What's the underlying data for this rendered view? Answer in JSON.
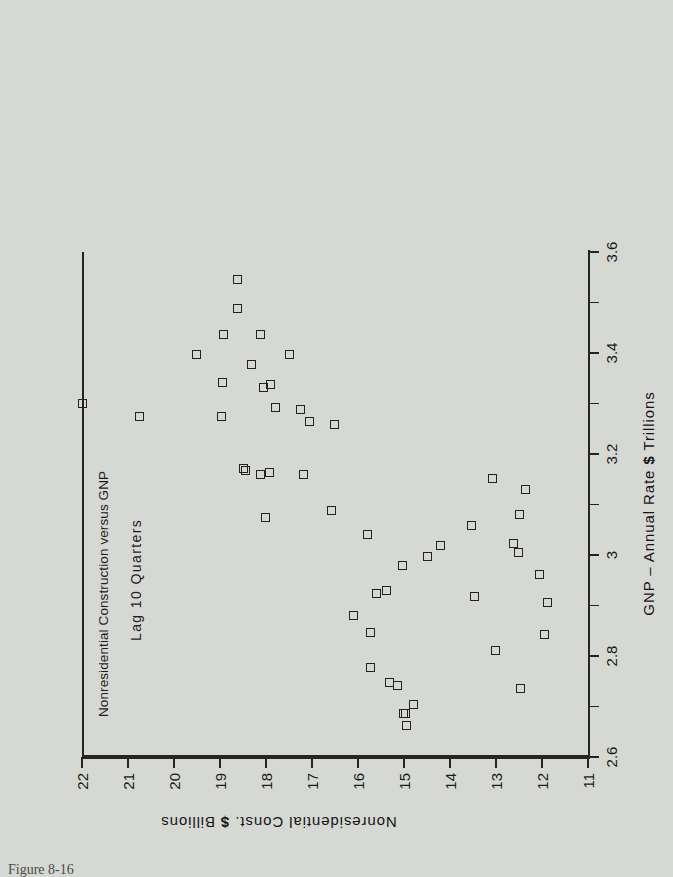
{
  "figure": {
    "background_color": "#d6d8d3",
    "ink_color": "#222222",
    "caption": "Figure 8-16"
  },
  "title": {
    "main": "Nonresidential Construction versus GNP",
    "subtitle": "Lag 10 Quarters"
  },
  "axes": {
    "x_title_part1": "GNP",
    "x_title_dash": "–",
    "x_title_part2": "Annual Rate",
    "x_title_dollar": "$",
    "x_title_part3": "Trillions",
    "y_title_part1": "Nonresidential Const.",
    "y_title_dollar": "$",
    "y_title_part2": "Billions"
  },
  "chart_data": {
    "type": "scatter",
    "title": "Nonresidential Construction versus GNP",
    "subtitle": "Lag 10 Quarters",
    "xlabel": "GNP – Annual Rate $ Trillions",
    "ylabel": "Nonresidential Const. $ Billions",
    "xlim": [
      2.6,
      3.6
    ],
    "ylim": [
      11,
      22
    ],
    "grid": false,
    "legend": null,
    "marker": "open-square",
    "xticks_major": [
      "2.6",
      "2.8",
      "3",
      "3.2",
      "3.4",
      "3.6"
    ],
    "xticks_major_values": [
      2.6,
      2.8,
      3.0,
      3.2,
      3.4,
      3.6
    ],
    "xticks_minor_values": [
      2.7,
      2.9,
      3.1,
      3.3,
      3.5
    ],
    "yticks": [
      "11",
      "12",
      "13",
      "14",
      "15",
      "16",
      "17",
      "18",
      "19",
      "20",
      "21",
      "22"
    ],
    "yticks_values": [
      11,
      12,
      13,
      14,
      15,
      16,
      17,
      18,
      19,
      20,
      21,
      22
    ],
    "points": [
      {
        "x": 3.545,
        "y": 18.62
      },
      {
        "x": 3.489,
        "y": 18.62
      },
      {
        "x": 3.437,
        "y": 18.93
      },
      {
        "x": 3.437,
        "y": 18.12
      },
      {
        "x": 3.398,
        "y": 19.52
      },
      {
        "x": 3.398,
        "y": 17.48
      },
      {
        "x": 3.377,
        "y": 18.32
      },
      {
        "x": 3.341,
        "y": 18.95
      },
      {
        "x": 3.338,
        "y": 17.91
      },
      {
        "x": 3.331,
        "y": 18.06
      },
      {
        "x": 3.3,
        "y": 22.0
      },
      {
        "x": 3.293,
        "y": 17.8
      },
      {
        "x": 3.289,
        "y": 17.26
      },
      {
        "x": 3.274,
        "y": 18.96
      },
      {
        "x": 3.274,
        "y": 20.75
      },
      {
        "x": 3.265,
        "y": 17.06
      },
      {
        "x": 3.258,
        "y": 16.52
      },
      {
        "x": 3.171,
        "y": 18.5
      },
      {
        "x": 3.168,
        "y": 18.44
      },
      {
        "x": 3.164,
        "y": 17.92
      },
      {
        "x": 3.16,
        "y": 18.11
      },
      {
        "x": 3.16,
        "y": 17.18
      },
      {
        "x": 3.152,
        "y": 13.08
      },
      {
        "x": 3.129,
        "y": 12.35
      },
      {
        "x": 3.088,
        "y": 16.57
      },
      {
        "x": 3.081,
        "y": 12.48
      },
      {
        "x": 3.074,
        "y": 18.02
      },
      {
        "x": 3.059,
        "y": 13.53
      },
      {
        "x": 3.041,
        "y": 15.79
      },
      {
        "x": 3.023,
        "y": 12.62
      },
      {
        "x": 3.018,
        "y": 14.21
      },
      {
        "x": 3.005,
        "y": 12.51
      },
      {
        "x": 2.998,
        "y": 14.5
      },
      {
        "x": 2.979,
        "y": 15.04
      },
      {
        "x": 2.962,
        "y": 12.06
      },
      {
        "x": 2.93,
        "y": 15.38
      },
      {
        "x": 2.924,
        "y": 15.6
      },
      {
        "x": 2.918,
        "y": 13.47
      },
      {
        "x": 2.906,
        "y": 11.89
      },
      {
        "x": 2.88,
        "y": 16.09
      },
      {
        "x": 2.846,
        "y": 15.72
      },
      {
        "x": 2.843,
        "y": 11.95
      },
      {
        "x": 2.811,
        "y": 13.02
      },
      {
        "x": 2.778,
        "y": 15.73
      },
      {
        "x": 2.748,
        "y": 15.31
      },
      {
        "x": 2.742,
        "y": 15.14
      },
      {
        "x": 2.735,
        "y": 12.46
      },
      {
        "x": 2.703,
        "y": 14.8
      },
      {
        "x": 2.687,
        "y": 14.97
      },
      {
        "x": 2.686,
        "y": 15.02
      },
      {
        "x": 2.662,
        "y": 14.94
      }
    ]
  }
}
